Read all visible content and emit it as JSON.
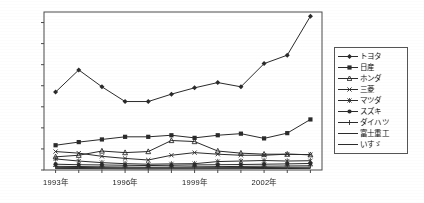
{
  "chart_data": {
    "type": "line",
    "title": "",
    "xlabel": "",
    "ylabel": "",
    "ylim": [
      0,
      1500
    ],
    "yticks": [
      0,
      200,
      400,
      600,
      800,
      1000,
      1200,
      1400
    ],
    "grid": false,
    "legend_position": "right",
    "x": [
      "1993年",
      "1994年",
      "1995年",
      "1996年",
      "1997年",
      "1998年",
      "1999年",
      "2000年",
      "2001年",
      "2002年",
      "2003年",
      "2004年"
    ],
    "xtick_labels": [
      "1993年",
      "1996年",
      "1999年",
      "2002年"
    ],
    "xtick_indices": [
      0,
      3,
      6,
      9
    ],
    "series": [
      {
        "name": "トヨタ",
        "marker": "diamond",
        "values": [
          740,
          950,
          790,
          650,
          650,
          720,
          780,
          830,
          790,
          1010,
          1090,
          1460
        ]
      },
      {
        "name": "日産",
        "marker": "square",
        "values": [
          235,
          265,
          290,
          315,
          315,
          330,
          305,
          330,
          345,
          300,
          350,
          480
        ]
      },
      {
        "name": "ホンダ",
        "marker": "triangle",
        "values": [
          125,
          140,
          180,
          165,
          175,
          280,
          270,
          180,
          160,
          150,
          150,
          145
        ]
      },
      {
        "name": "三菱",
        "marker": "cross",
        "values": [
          175,
          160,
          130,
          110,
          95,
          140,
          165,
          150,
          140,
          140,
          150,
          145
        ]
      },
      {
        "name": "マツダ",
        "marker": "star",
        "values": [
          105,
          85,
          70,
          60,
          55,
          58,
          60,
          80,
          85,
          90,
          85,
          88
        ]
      },
      {
        "name": "スズキ",
        "marker": "circle",
        "values": [
          55,
          50,
          48,
          45,
          42,
          45,
          48,
          50,
          52,
          55,
          58,
          62
        ]
      },
      {
        "name": "ダイハツ",
        "marker": "plus",
        "values": [
          35,
          33,
          30,
          28,
          26,
          28,
          30,
          32,
          34,
          36,
          38,
          40
        ]
      },
      {
        "name": "富士重工",
        "marker": "line",
        "values": [
          25,
          24,
          22,
          20,
          19,
          20,
          21,
          22,
          23,
          24,
          25,
          26
        ]
      },
      {
        "name": "いすゞ",
        "marker": "line",
        "values": [
          15,
          14,
          13,
          12,
          11,
          12,
          12,
          13,
          13,
          14,
          14,
          15
        ]
      }
    ]
  },
  "colors": {
    "axis": "#4a4a4a",
    "line": "#2b2b2b",
    "text": "#141414",
    "background": "#ffffff",
    "legend_border": "#555555"
  }
}
